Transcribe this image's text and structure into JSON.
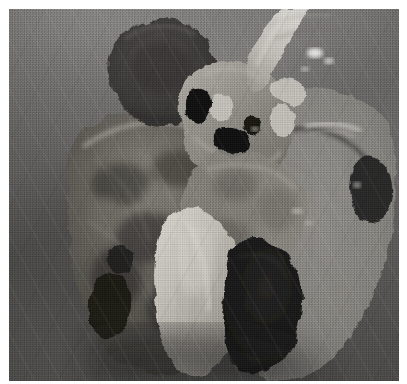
{
  "image": {
    "kind": "photograph",
    "subject": "gross pathology specimen",
    "modality": "grayscale print photograph",
    "orientation": "landscape-square",
    "visible_text": "",
    "caption": "",
    "labels": [],
    "annotations": []
  },
  "frame": {
    "page_width_px": 407,
    "page_height_px": 384,
    "photo_left_px": 9,
    "photo_top_px": 9,
    "photo_width_px": 390,
    "photo_height_px": 375,
    "page_background": "#ffffff"
  },
  "palette": {
    "page_white": "#ffffff",
    "background_cloth_light": "#8b8987",
    "background_cloth_mid": "#7e7c7b",
    "background_cloth_dark": "#6b6967",
    "shadow_deep": "#141414",
    "shadow_mid": "#3a3a39",
    "tissue_mid": "#8e8c89",
    "tissue_dark": "#4d4b49",
    "tissue_light": "#b5b2ae",
    "highlight_bright": "#d2cfca",
    "specular_white": "#f2f1ee",
    "membrane_translucent": "#97958f"
  },
  "regions": [
    {
      "id": "upper-left-mass",
      "name": "dark rounded mass",
      "description": "dark ovoid nodular mass at upper left of specimen",
      "center": [
        148,
        55
      ],
      "radius": [
        52,
        40
      ],
      "tone": "#3f3d3c"
    },
    {
      "id": "hilum",
      "name": "hilar region with bronchi and vessels",
      "description": "pale branching bronchial and vascular structures at center top",
      "center": [
        232,
        95
      ],
      "tone": "#a8a5a0"
    },
    {
      "id": "bronchus-stump",
      "name": "cut bronchus",
      "description": "pale tubular cut bronchus running up and to the right",
      "center": [
        252,
        45
      ],
      "tone": "#c4c1bb"
    },
    {
      "id": "dark-ostium-upper",
      "name": "bronchial lumen opening",
      "description": "small black airway lumen",
      "center": [
        196,
        95
      ],
      "tone": "#101010"
    },
    {
      "id": "dark-ostium-lower",
      "name": "second bronchial lumen",
      "description": "black airway opening below first",
      "center": [
        222,
        128
      ],
      "tone": "#101010"
    },
    {
      "id": "left-lobe",
      "name": "left lung lobe cut surface",
      "description": "large mottled dark parenchymal cut surface occupying left-center",
      "center": [
        150,
        215
      ],
      "tone": "#58564f"
    },
    {
      "id": "bright-lobe",
      "name": "pale elongated lobe",
      "description": "bright leaf-shaped lobe descending to bottom center",
      "center": [
        190,
        285
      ],
      "tone": "#c0bcb4"
    },
    {
      "id": "right-membrane",
      "name": "translucent pleural membrane",
      "description": "flat translucent membranous lung sheet on right with fine vessel markings",
      "center": [
        315,
        200
      ],
      "tone": "#8d8b85"
    },
    {
      "id": "dark-notch",
      "name": "dark shadowed recess",
      "description": "deep black shadow notch at lower right of specimen",
      "center": [
        262,
        300
      ],
      "tone": "#151514"
    },
    {
      "id": "specular-streaks",
      "name": "wet surface specular highlights",
      "description": "small bright white glints on moist tissue, upper right",
      "center": [
        310,
        50
      ],
      "tone": "#f2f1ee"
    }
  ]
}
